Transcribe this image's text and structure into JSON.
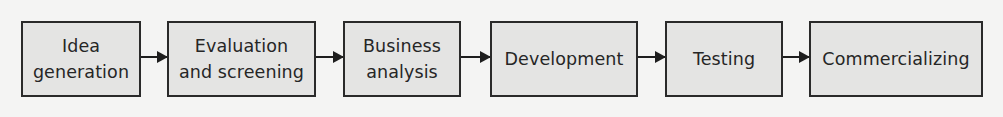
{
  "diagram": {
    "type": "flowchart",
    "direction": "left-to-right",
    "colors": {
      "background": "#f4f4f3",
      "box_fill": "#e4e4e3",
      "box_border": "#2a2a2a",
      "text": "#262626",
      "arrow": "#1e1e1e"
    },
    "steps": [
      {
        "label": "Idea\ngeneration"
      },
      {
        "label": "Evaluation\nand screening"
      },
      {
        "label": "Business\nanalysis"
      },
      {
        "label": "Development"
      },
      {
        "label": "Testing"
      },
      {
        "label": "Commercializing"
      }
    ],
    "edges": [
      {
        "from": "Idea generation",
        "to": "Evaluation and screening"
      },
      {
        "from": "Evaluation and screening",
        "to": "Business analysis"
      },
      {
        "from": "Business analysis",
        "to": "Development"
      },
      {
        "from": "Development",
        "to": "Testing"
      },
      {
        "from": "Testing",
        "to": "Commercializing"
      }
    ]
  }
}
